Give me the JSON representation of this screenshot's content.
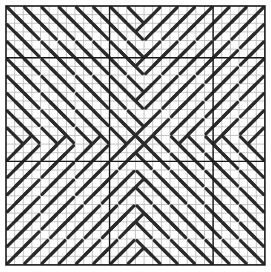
{
  "chart_data": {
    "type": "needlepoint-stitch-chart",
    "grid": {
      "cols": 30,
      "rows": 30,
      "origin_x": 6,
      "origin_y": 6,
      "cell": 8.63
    },
    "heavy_lines": {
      "vertical": [
        12,
        24
      ],
      "horizontal": [
        6,
        18
      ]
    },
    "stitch_length_cells": 2,
    "ring_period": 4,
    "gap_ring_index": 3,
    "quadrant_directions": {
      "top_left": "backslash",
      "top_right": "slash",
      "bottom_left": "slash",
      "bottom_right": "backslash"
    }
  },
  "colors": {
    "background": "#ffffff",
    "grid_line": "#b8b8b8",
    "heavy_line": "#1a1a1a",
    "border": "#1a1a1a",
    "stitch": "#2a2a2a"
  }
}
